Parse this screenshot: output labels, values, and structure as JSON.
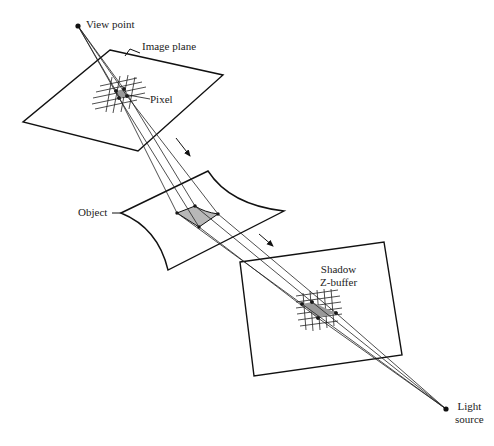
{
  "diagram": {
    "labels": {
      "view_point": "View point",
      "image_plane": "Image plane",
      "pixel": "Pixel",
      "object": "Object",
      "shadow_zbuffer_line1": "Shadow",
      "shadow_zbuffer_line2": "Z-buffer",
      "light_source_line1": "Light",
      "light_source_line2": "source"
    },
    "colors": {
      "stroke": "#111111",
      "fill_patch": "#b8b8b8",
      "background": "#ffffff"
    },
    "points": {
      "view_point": [
        78,
        26
      ],
      "light_source": [
        446,
        409
      ]
    },
    "shapes": {
      "image_plane": [
        [
          110,
          50
        ],
        [
          223,
          75
        ],
        [
          138,
          151
        ],
        [
          23,
          122
        ]
      ],
      "object_surface": {
        "left": [
          121,
          213
        ],
        "top": [
          208,
          171
        ],
        "right": [
          284,
          211
        ],
        "bottom": [
          168,
          270
        ]
      },
      "shadow_zbuffer": [
        [
          240,
          262
        ],
        [
          384,
          242
        ],
        [
          402,
          355
        ],
        [
          254,
          376
        ]
      ]
    },
    "arrows": [
      {
        "from": [
          176,
          138
        ],
        "to": [
          190,
          158
        ]
      },
      {
        "from": [
          259,
          234
        ],
        "to": [
          274,
          247
        ]
      }
    ]
  }
}
